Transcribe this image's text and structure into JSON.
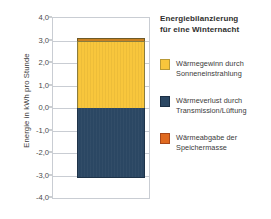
{
  "chart_data": {
    "type": "bar",
    "title": "Energiebilanzierung für eine Winternacht",
    "xlabel": "",
    "ylabel": "Energie in kWh pro Stunde",
    "ylim": [
      -4.0,
      4.0
    ],
    "yticks": [
      "4,0",
      "3,0",
      "2,0",
      "1,0",
      "0,0",
      "-1,0",
      "-2,0",
      "-3,0",
      "-4,0"
    ],
    "ytick_values": [
      4.0,
      3.0,
      2.0,
      1.0,
      0.0,
      -1.0,
      -2.0,
      -3.0,
      -4.0
    ],
    "grid": true,
    "legend_position": "right",
    "categories": [
      "Winternacht"
    ],
    "series": [
      {
        "name": "Wärmegewinn durch Sonneneinstrahlung",
        "color": "#F8C63C",
        "values": [
          3.0
        ]
      },
      {
        "name": "Wärmeabgabe der Speichermasse",
        "color": "#E06A20",
        "values": [
          0.1
        ]
      },
      {
        "name": "Wärmeverlust durch Transmission/Lüftung",
        "color": "#2B4763",
        "values": [
          -3.1
        ]
      }
    ],
    "stack_top": 3.1,
    "stack_bottom": -3.1
  },
  "axis": {
    "y_title": "Energie in kWh pro Stunde",
    "ticks": [
      {
        "label": "4,0",
        "value": 4.0
      },
      {
        "label": "3,0",
        "value": 3.0
      },
      {
        "label": "2,0",
        "value": 2.0
      },
      {
        "label": "1,0",
        "value": 1.0
      },
      {
        "label": "0,0",
        "value": 0.0
      },
      {
        "label": "-1,0",
        "value": -1.0
      },
      {
        "label": "-2,0",
        "value": -2.0
      },
      {
        "label": "-3,0",
        "value": -3.0
      },
      {
        "label": "-4,0",
        "value": -4.0
      }
    ]
  },
  "legend": {
    "title_line1": "Energiebilanzierung",
    "title_line2": "für eine Winternacht",
    "items": [
      {
        "line1": "Wärmegewinn durch",
        "line2": "Sonneneinstrahlung",
        "color": "#F8C63C"
      },
      {
        "line1": "Wärmeverlust durch",
        "line2": "Transmission/Lüftung",
        "color": "#2B4763"
      },
      {
        "line1": "Wärmeabgabe der",
        "line2": "Speichermasse",
        "color": "#E06A20"
      }
    ]
  }
}
